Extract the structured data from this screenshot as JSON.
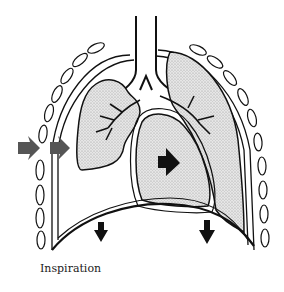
{
  "figure": {
    "caption": "Inspiration",
    "structures": [
      "trachea",
      "bronchi",
      "left-lung",
      "right-lung",
      "heart",
      "ribs",
      "diaphragm",
      "chest-wall"
    ],
    "arrows": [
      {
        "name": "chest-wall-outer-arrow",
        "direction": "right",
        "color": "#555555"
      },
      {
        "name": "chest-wall-inner-arrow",
        "direction": "right",
        "color": "#555555"
      },
      {
        "name": "heart-arrow",
        "direction": "right",
        "color": "#111111"
      },
      {
        "name": "diaphragm-left-arrow",
        "direction": "down",
        "color": "#111111"
      },
      {
        "name": "diaphragm-right-arrow",
        "direction": "down",
        "color": "#111111"
      }
    ],
    "colors": {
      "stroke": "#111111",
      "lung_fill": "#d8d8d8",
      "background": "#ffffff"
    }
  }
}
